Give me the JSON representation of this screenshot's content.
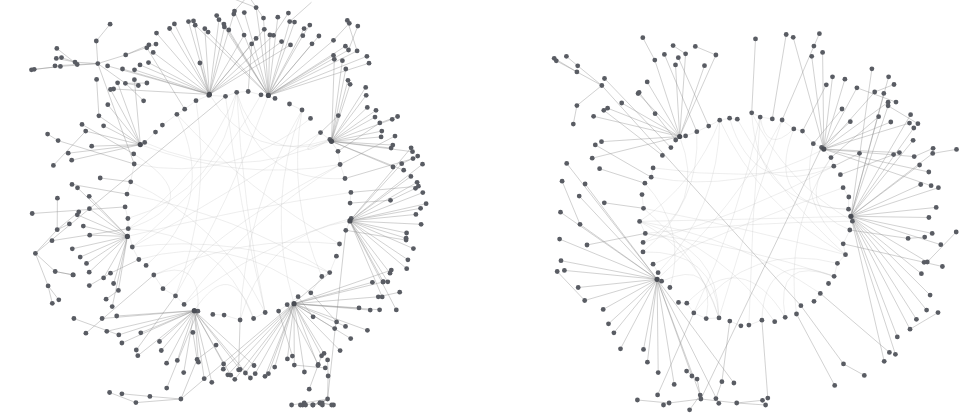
{
  "figure": {
    "type": "network-graph-pair",
    "background_color": "#ffffff",
    "node_color": "#595c63",
    "hub_node_color": "#4a4d54",
    "edge_color": "#8a8a8a",
    "chord_color": "#b9b9b9",
    "node_radius": 2.4,
    "hub_radius": 2.6,
    "width": 973,
    "height": 415,
    "panels": [
      {
        "name": "left-network-graph",
        "x": 0,
        "y": 0,
        "width": 487,
        "height": 415
      },
      {
        "name": "right-network-graph",
        "x": 486,
        "y": 0,
        "width": 487,
        "height": 415
      }
    ]
  },
  "chart_data": [
    {
      "type": "scatter",
      "name": "left-network-graph",
      "title": "",
      "subtitle": "",
      "xlabel": "",
      "ylabel": "",
      "grid": false,
      "legend": "none",
      "layout": "circular-with-radial-leaves",
      "center": [
        237,
        205
      ],
      "ring_radius": 112,
      "ring_node_count": 52,
      "hub_count": 8,
      "hubs": [
        {
          "id": "L-H1",
          "angle_deg": 104,
          "leaf_count": 22,
          "spread_deg": 64,
          "leaf_radius": 180
        },
        {
          "id": "L-H2",
          "angle_deg": 74,
          "leaf_count": 24,
          "spread_deg": 56,
          "leaf_radius": 186
        },
        {
          "id": "L-H3",
          "angle_deg": 34,
          "leaf_count": 18,
          "spread_deg": 46,
          "leaf_radius": 172
        },
        {
          "id": "L-H4",
          "angle_deg": 352,
          "leaf_count": 20,
          "spread_deg": 52,
          "leaf_radius": 178
        },
        {
          "id": "L-H5",
          "angle_deg": 300,
          "leaf_count": 26,
          "spread_deg": 72,
          "leaf_radius": 168
        },
        {
          "id": "L-H6",
          "angle_deg": 248,
          "leaf_count": 20,
          "spread_deg": 58,
          "leaf_radius": 170
        },
        {
          "id": "L-H7",
          "angle_deg": 196,
          "leaf_count": 14,
          "spread_deg": 44,
          "leaf_radius": 158
        },
        {
          "id": "L-H8",
          "angle_deg": 148,
          "leaf_count": 10,
          "spread_deg": 36,
          "leaf_radius": 164
        }
      ],
      "peripheral_trees": 4,
      "chord_count": 26,
      "approx_total_nodes": 285
    },
    {
      "type": "scatter",
      "name": "right-network-graph",
      "title": "",
      "subtitle": "",
      "xlabel": "",
      "ylabel": "",
      "grid": false,
      "legend": "none",
      "layout": "circular-with-radial-leaves",
      "center": [
        745,
        220
      ],
      "ring_radius": 104,
      "ring_node_count": 58,
      "hub_count": 4,
      "hubs": [
        {
          "id": "R-H1",
          "angle_deg": 2,
          "leaf_count": 24,
          "spread_deg": 96,
          "leaf_radius": 192
        },
        {
          "id": "R-H2",
          "angle_deg": 42,
          "leaf_count": 14,
          "spread_deg": 64,
          "leaf_radius": 178
        },
        {
          "id": "R-H3",
          "angle_deg": 214,
          "leaf_count": 22,
          "spread_deg": 104,
          "leaf_radius": 176
        },
        {
          "id": "R-H4",
          "angle_deg": 128,
          "leaf_count": 12,
          "spread_deg": 58,
          "leaf_radius": 172
        }
      ],
      "peripheral_trees": 2,
      "chord_count": 34,
      "approx_total_nodes": 196
    }
  ]
}
